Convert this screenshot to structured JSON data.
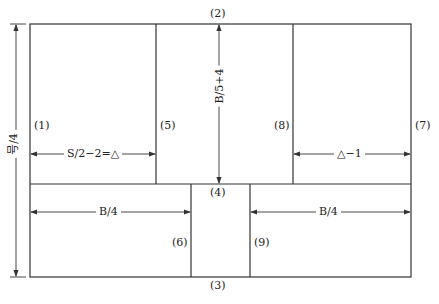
{
  "diagram": {
    "type": "pattern-draft",
    "point_labels": {
      "p1": "(1)",
      "p2": "(2)",
      "p3": "(3)",
      "p4": "(4)",
      "p5": "(5)",
      "p6": "(6)",
      "p7": "(7)",
      "p8": "(8)",
      "p9": "(9)"
    },
    "dimensions": {
      "left_height": "号/4",
      "center_height": "B/5+4",
      "top_left_width": "S/2−2=△",
      "top_right_width": "△−1",
      "bottom_left_width": "B/4",
      "bottom_right_width": "B/4"
    },
    "colors": {
      "line": "#333333",
      "background": "#ffffff"
    }
  }
}
